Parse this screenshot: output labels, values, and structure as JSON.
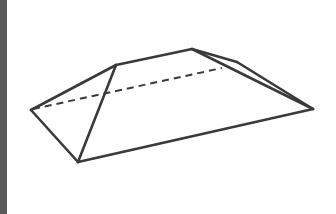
{
  "figure": {
    "colors": {
      "stroke": "#3a3a3a",
      "background": "#ffffff",
      "left_strip": "#5a5a5a"
    },
    "vertices": {
      "left": [
        31,
        110
      ],
      "bottom_front": [
        78,
        162
      ],
      "right": [
        313,
        109
      ],
      "ridge_left": [
        116,
        65
      ],
      "ridge_right": [
        192,
        49
      ],
      "back_right": [
        237,
        62
      ],
      "hidden_back": [
        222,
        68
      ]
    }
  }
}
